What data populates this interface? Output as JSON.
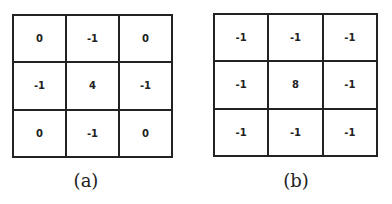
{
  "kernels": [
    {
      "caption": "(a)",
      "values": [
        "0",
        "-1",
        "0",
        "-1",
        "4",
        "-1",
        "0",
        "-1",
        "0"
      ]
    },
    {
      "caption": "(b)",
      "values": [
        "-1",
        "-1",
        "-1",
        "-1",
        "8",
        "-1",
        "-1",
        "-1",
        "-1"
      ]
    }
  ]
}
